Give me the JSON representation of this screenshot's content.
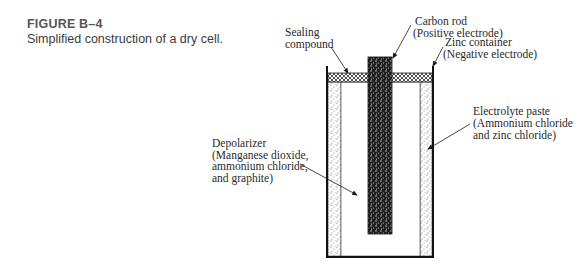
{
  "caption": {
    "figure_number": "FIGURE B–4",
    "text": "Simplified construction of a dry cell."
  },
  "labels": {
    "sealing": [
      "Sealing",
      "compound"
    ],
    "carbon": [
      "Carbon rod",
      "(Positive electrode)"
    ],
    "zinc": [
      "Zinc container",
      "(Negative electrode)"
    ],
    "electrolyte": [
      "Electrolyte paste",
      "(Ammonium chloride",
      "and zinc chloride)"
    ],
    "depolarizer": [
      "Depolarizer",
      "(Manganese dioxide,",
      "ammonium chloride,",
      "and graphite)"
    ]
  },
  "colors": {
    "ink": "#1a1a1a",
    "text": "#2a2a2a"
  }
}
